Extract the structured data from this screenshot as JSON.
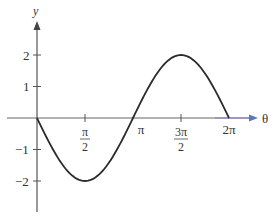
{
  "chart_data": {
    "type": "line",
    "title": "",
    "xlabel": "θ",
    "ylabel": "y",
    "function": "y = -2 sin(θ)",
    "xlim": [
      0,
      6.2832
    ],
    "ylim": [
      -3,
      3
    ],
    "grid": false,
    "legend": null,
    "x_ticks": [
      {
        "value": 1.5708,
        "label_num": "π",
        "label_den": "2"
      },
      {
        "value": 3.1416,
        "label": "π"
      },
      {
        "value": 4.7124,
        "label_num": "3π",
        "label_den": "2"
      },
      {
        "value": 6.2832,
        "label": "2π"
      }
    ],
    "y_ticks": [
      {
        "value": 2,
        "label": "2"
      },
      {
        "value": 1,
        "label": "1"
      },
      {
        "value": -1,
        "label": "−1"
      },
      {
        "value": -2,
        "label": "−2"
      }
    ],
    "series": [
      {
        "name": "y = -2 sin θ",
        "color": "#2a2a2a",
        "x": [
          0,
          0.7854,
          1.5708,
          2.3562,
          3.1416,
          3.927,
          4.7124,
          5.4978,
          6.2832
        ],
        "values": [
          0,
          -1.414,
          -2,
          -1.414,
          0,
          1.414,
          2,
          1.414,
          0
        ]
      }
    ]
  },
  "colors": {
    "axis": "#555555",
    "curve": "#2a2a2a",
    "x_arrow": "#6a7fc0"
  }
}
